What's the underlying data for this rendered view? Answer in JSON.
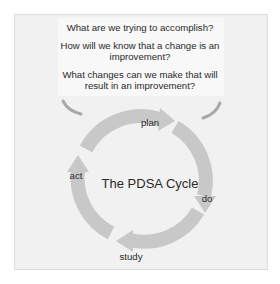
{
  "diagram": {
    "title": "The PDSA Cycle",
    "questions": [
      {
        "line1": "What are we trying to accomplish?"
      },
      {
        "line1": "How will we know that a change is an",
        "line2": "improvement?"
      },
      {
        "line1": "What changes can we make that will",
        "line2": "result in an improvement?"
      }
    ],
    "stages": [
      {
        "id": "plan",
        "label": "plan"
      },
      {
        "id": "do",
        "label": "do"
      },
      {
        "id": "study",
        "label": "study"
      },
      {
        "id": "act",
        "label": "act"
      }
    ],
    "colors": {
      "ring": "#c8c8c8",
      "side_arrows": "#a8a8a8",
      "panel": "#f1f1f1",
      "question_box": "#f8f8f8",
      "text": "#2a2a2a"
    }
  }
}
